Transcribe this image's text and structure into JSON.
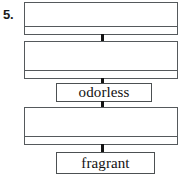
{
  "page": {
    "background_color": "#ffffff",
    "line_color": "#55595c",
    "connector_color": "#141414",
    "text_color": "#111111"
  },
  "exercise": {
    "number_label": "5.",
    "type": "flow-diagram"
  },
  "diagram": {
    "kind": "vertical-chain",
    "nodes": [
      {
        "id": "node-1",
        "style": "blank-wide",
        "label": "",
        "has_divider": true,
        "x": 24,
        "y": 2,
        "width": 154,
        "height": 33,
        "divider_offset": 23
      },
      {
        "id": "node-2",
        "style": "blank-wide",
        "label": "",
        "has_divider": true,
        "x": 24,
        "y": 41,
        "width": 154,
        "height": 38,
        "divider_offset": 28
      },
      {
        "id": "node-3",
        "style": "labeled",
        "label": "odorless",
        "has_divider": false,
        "x": 56,
        "y": 83,
        "width": 96,
        "height": 19
      },
      {
        "id": "node-4",
        "style": "blank-wide",
        "label": "",
        "has_divider": true,
        "x": 24,
        "y": 107,
        "width": 154,
        "height": 38,
        "divider_offset": 28
      },
      {
        "id": "node-5",
        "style": "labeled",
        "label": "fragrant",
        "has_divider": false,
        "x": 56,
        "y": 152,
        "width": 99,
        "height": 22
      }
    ],
    "connectors": [
      {
        "id": "connector-1-2",
        "x": 101,
        "y": 34,
        "height": 8
      },
      {
        "id": "connector-2-3",
        "x": 101,
        "y": 78,
        "height": 6
      },
      {
        "id": "connector-3-4",
        "x": 101,
        "y": 101,
        "height": 7
      },
      {
        "id": "connector-4-5",
        "x": 101,
        "y": 144,
        "height": 9
      }
    ]
  }
}
